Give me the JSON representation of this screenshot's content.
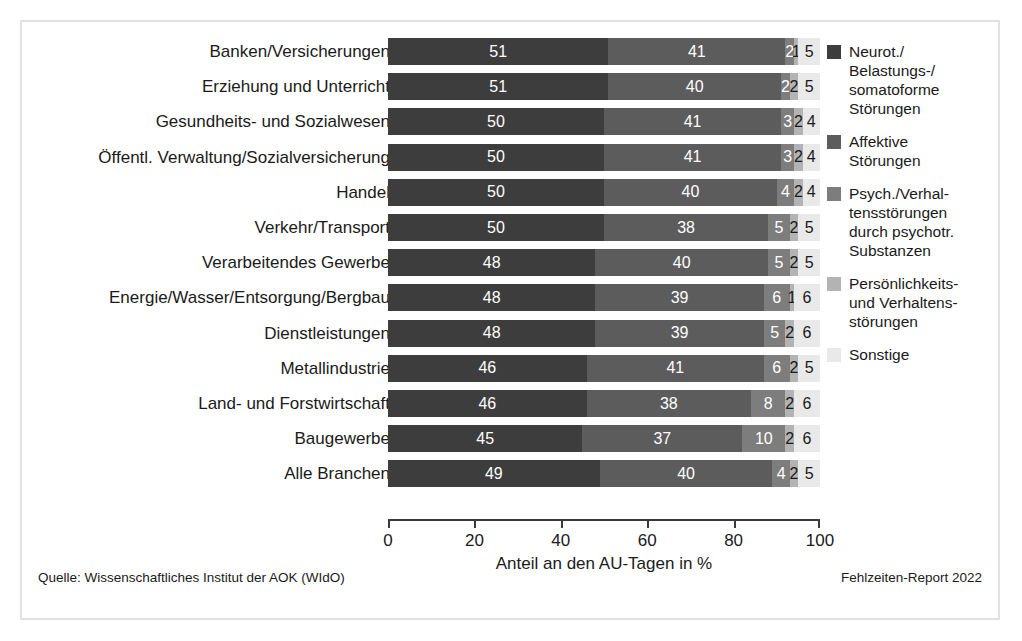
{
  "chart_data": {
    "type": "bar",
    "subtype": "horizontal-stacked-100",
    "title": "",
    "xlabel": "Anteil an den AU-Tagen in %",
    "ylabel": "",
    "xlim": [
      0,
      100
    ],
    "xticks": [
      0,
      20,
      40,
      60,
      80,
      100
    ],
    "xtick_labels": [
      "0",
      "20",
      "40",
      "60",
      "80",
      "100"
    ],
    "grid": false,
    "legend_position": "right",
    "categories": [
      "Banken/Versicherungen",
      "Erziehung und Unterricht",
      "Gesundheits- und Sozialwesen",
      "Öffentl. Verwaltung/Sozialversicherung",
      "Handel",
      "Verkehr/Transport",
      "Verarbeitendes Gewerbe",
      "Energie/Wasser/Entsorgung/Bergbau",
      "Dienstleistungen",
      "Metallindustrie",
      "Land- und Forstwirtschaft",
      "Baugewerbe",
      "Alle Branchen"
    ],
    "series": [
      {
        "name": "Neurot./\nBelastungs-/\nsomatoforme\nStörungen",
        "color": "#3d3d3d",
        "values": [
          51,
          51,
          50,
          50,
          50,
          50,
          48,
          48,
          48,
          46,
          46,
          45,
          49
        ]
      },
      {
        "name": "Affektive\nStörungen",
        "color": "#5c5c5c",
        "values": [
          41,
          40,
          41,
          41,
          40,
          38,
          40,
          39,
          39,
          41,
          38,
          37,
          40
        ]
      },
      {
        "name": "Psych./Verhal-\ntensstörungen\ndurch psychotr.\nSubstanzen",
        "color": "#7d7d7d",
        "values": [
          2,
          2,
          3,
          3,
          4,
          5,
          5,
          6,
          5,
          6,
          8,
          10,
          4
        ]
      },
      {
        "name": "Persönlichkeits-\nund Verhaltens-\nstörungen",
        "color": "#b3b3b3",
        "values": [
          1,
          2,
          2,
          2,
          2,
          2,
          2,
          1,
          2,
          2,
          2,
          2,
          2
        ]
      },
      {
        "name": "Sonstige",
        "color": "#e9e9e9",
        "values": [
          5,
          5,
          4,
          4,
          4,
          5,
          5,
          6,
          6,
          5,
          6,
          6,
          5
        ]
      }
    ]
  },
  "footer": {
    "source": "Quelle: Wissenschaftliches Institut der AOK (WIdO)",
    "report": "Fehlzeiten-Report 2022"
  }
}
